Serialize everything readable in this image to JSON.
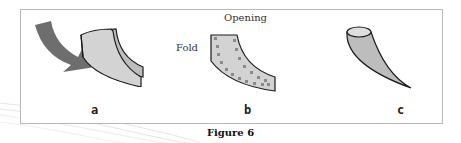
{
  "figure": {
    "caption": "Figure 6",
    "panels": [
      {
        "id": "a",
        "label": "a",
        "description": "curved sheet with arrow showing folding motion"
      },
      {
        "id": "b",
        "label": "b",
        "description": "folded shape with dotted fold/seam line",
        "annotations": {
          "opening": "Opening",
          "fold": "Fold"
        }
      },
      {
        "id": "c",
        "label": "c",
        "description": "resulting cone/horn shape"
      }
    ],
    "colors": {
      "shape_fill": "#d3d3d3",
      "shape_dark_fill": "#bdbdbd",
      "arrow": "#6e6e6e",
      "outline": "#1a1a1a",
      "dots": "#8a8a8a",
      "frame": "#b8b8b8"
    }
  }
}
